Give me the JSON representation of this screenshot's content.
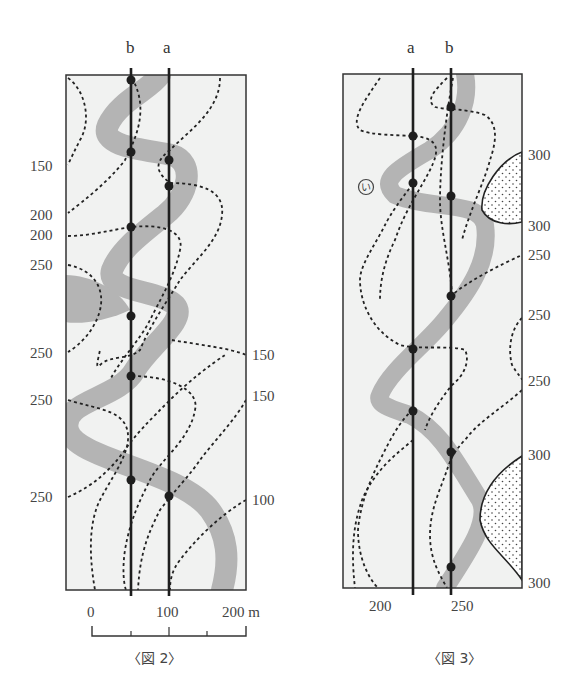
{
  "top_text_cutoff": "図2 ... 図3 ...",
  "figure2": {
    "caption": "〈図 2〉",
    "line_labels": [
      "b",
      "a"
    ],
    "left_contour_labels": [
      "150",
      "200",
      "200",
      "250",
      "250",
      "250",
      "250"
    ],
    "right_contour_labels": [
      "150",
      "150",
      "100"
    ],
    "scale": {
      "ticks": [
        "0",
        "100",
        "200 m"
      ]
    }
  },
  "figure3": {
    "caption": "〈図 3〉",
    "line_labels": [
      "a",
      "b"
    ],
    "marker": "い",
    "right_contour_labels": [
      "300",
      "300",
      "250",
      "250",
      "250",
      "300",
      "300"
    ],
    "bottom_labels": [
      "200",
      "250"
    ]
  },
  "colors": {
    "panel_fill": "#f1f2f1",
    "band": "#b4b4b4",
    "line": "#1e1e1e",
    "frame": "#333333",
    "contour": "#222222"
  }
}
